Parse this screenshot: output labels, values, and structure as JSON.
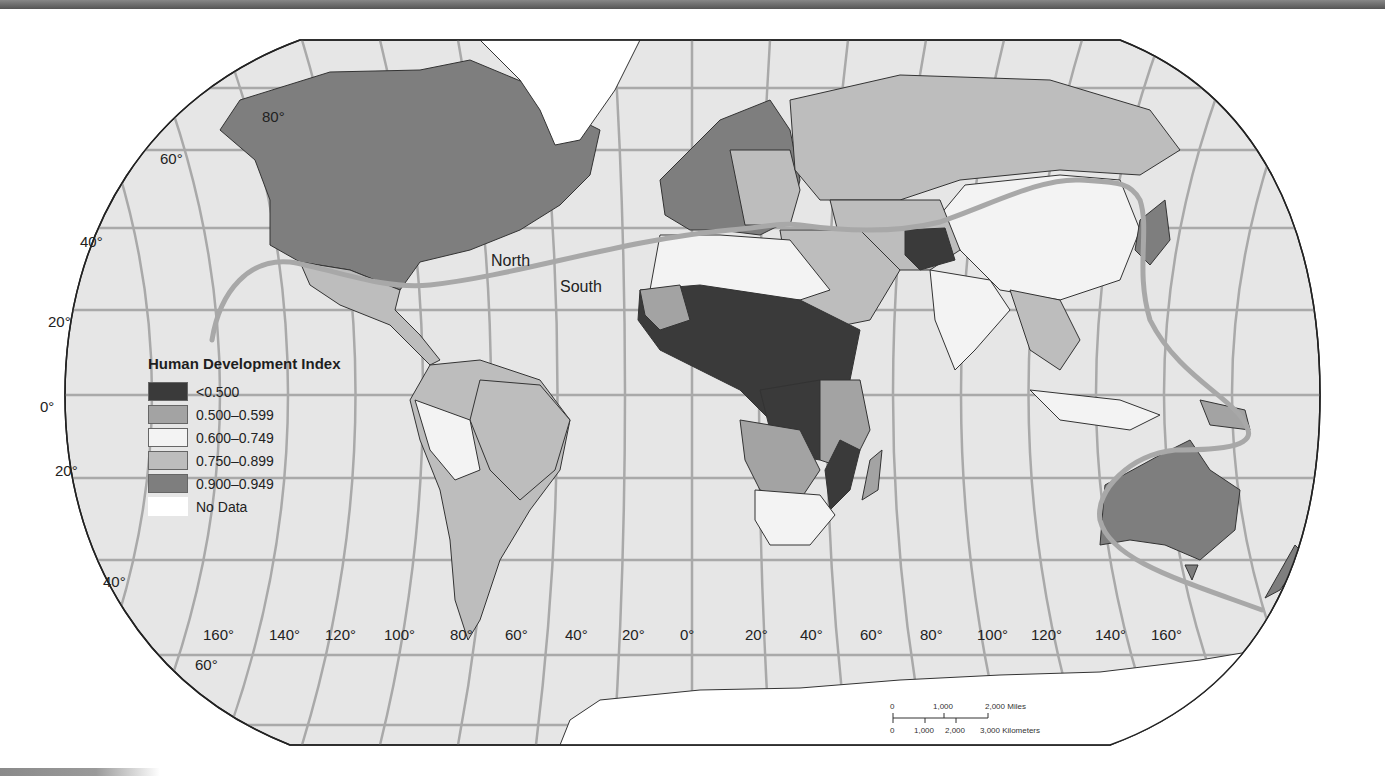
{
  "map": {
    "title": "Human Development Index",
    "projection": "Robinson",
    "colors": {
      "ocean": "#e6e6e6",
      "graticule": "#a9a9a9",
      "border": "#333333",
      "divide_line": "#a8a8a8"
    },
    "divide_labels": {
      "north": "North",
      "south": "South"
    },
    "latitude_labels": [
      "80°",
      "60°",
      "40°",
      "20°",
      "0°",
      "20°",
      "40°",
      "60°"
    ],
    "longitude_labels": [
      "160°",
      "140°",
      "120°",
      "100°",
      "80°",
      "60°",
      "40°",
      "20°",
      "0°",
      "20°",
      "40°",
      "60°",
      "80°",
      "100°",
      "120°",
      "140°",
      "160°"
    ]
  },
  "legend": {
    "title": "Human Development Index",
    "items": [
      {
        "label": "<0.500",
        "color": "#3a3a3a"
      },
      {
        "label": "0.500–0.599",
        "color": "#a3a3a3"
      },
      {
        "label": "0.600–0.749",
        "color": "#f3f3f3"
      },
      {
        "label": "0.750–0.899",
        "color": "#bdbdbd"
      },
      {
        "label": "0.900–0.949",
        "color": "#7e7e7e"
      },
      {
        "label": "No Data",
        "color": "#ffffff"
      }
    ]
  },
  "scale_bar": {
    "miles": [
      "0",
      "1,000",
      "2,000 Miles"
    ],
    "kilometers": [
      "0",
      "1,000",
      "2,000",
      "3,000 Kilometers"
    ]
  }
}
